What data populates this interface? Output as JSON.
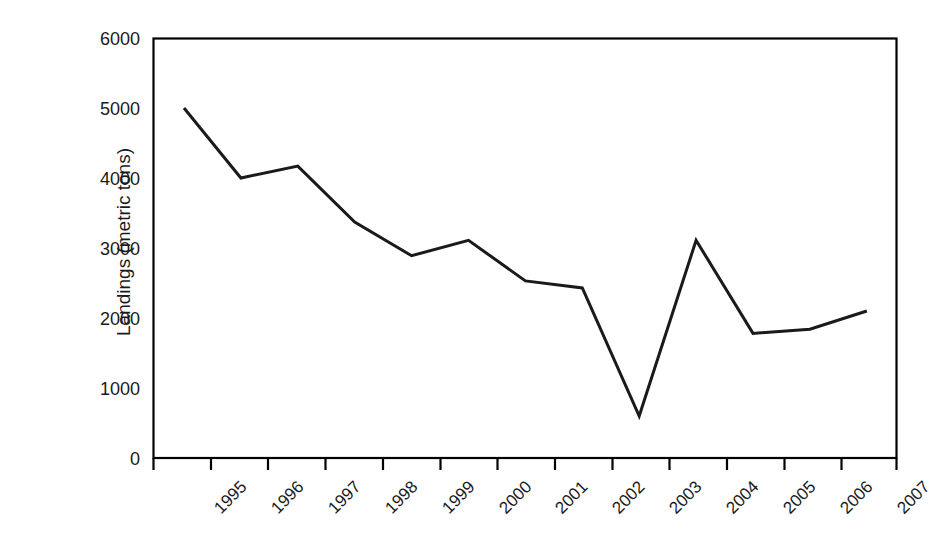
{
  "chart_data": {
    "type": "line",
    "title": "",
    "xlabel": "",
    "ylabel": "Landings (metric tons)",
    "categories": [
      "1995",
      "1996",
      "1997",
      "1998",
      "1999",
      "2000",
      "2001",
      "2002",
      "2003",
      "2004",
      "2005",
      "2006",
      "2007"
    ],
    "values": [
      5000,
      4000,
      4170,
      3370,
      2890,
      3110,
      2530,
      2430,
      600,
      3110,
      1780,
      1840,
      2100
    ],
    "series": [
      {
        "name": "Landings",
        "values": [
          5000,
          4000,
          4170,
          3370,
          2890,
          3110,
          2530,
          2430,
          600,
          3110,
          1780,
          1840,
          2100
        ]
      }
    ],
    "ylim": [
      0,
      6000
    ],
    "yticks": [
      "0",
      "1000",
      "2000",
      "3000",
      "4000",
      "5000",
      "6000"
    ],
    "ytick_values": [
      0,
      1000,
      2000,
      3000,
      4000,
      5000,
      6000
    ],
    "xticks": [
      "1995",
      "1996",
      "1997",
      "1998",
      "1999",
      "2000",
      "2001",
      "2002",
      "2003",
      "2004",
      "2005",
      "2006",
      "2007"
    ],
    "grid": false,
    "legend": false,
    "legend_position": "none",
    "line_color": "#1a1a1a",
    "frame_color": "#000000",
    "background_color": "#ffffff",
    "xtick_rotation": -45,
    "markers": false
  },
  "axis": {
    "y_title": "Landings (metric tons)"
  }
}
